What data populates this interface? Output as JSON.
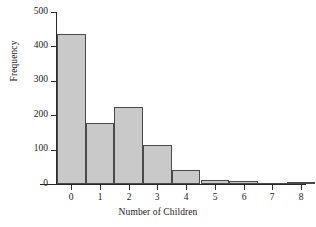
{
  "chart_data": {
    "type": "bar",
    "title": "",
    "xlabel": "Number of Children",
    "ylabel": "Frequency",
    "categories": [
      "0",
      "1",
      "2",
      "3",
      "4",
      "5",
      "6",
      "7",
      "8"
    ],
    "values": [
      437,
      178,
      224,
      113,
      41,
      11,
      10,
      1,
      5
    ],
    "xlim": [
      -0.5,
      8.5
    ],
    "ylim": [
      0,
      500
    ],
    "ytick_labels": [
      "0",
      "100",
      "200",
      "300",
      "400",
      "500"
    ],
    "ytick_values": [
      0,
      100,
      200,
      300,
      400,
      500
    ],
    "xtick_labels": [
      "0",
      "1",
      "2",
      "3",
      "4",
      "5",
      "6",
      "7",
      "8"
    ],
    "grid": false,
    "legend": null,
    "bar_fill_color": "#c9c9c9",
    "bar_edge_color": "#4a4a4a",
    "axis_color": "#2a2a2a",
    "background_color": "#ffffff"
  }
}
